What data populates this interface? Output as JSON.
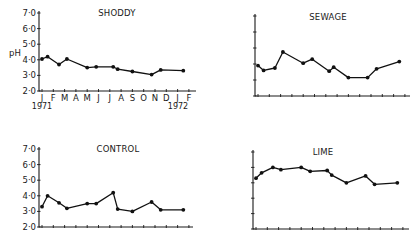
{
  "figure": {
    "ylabel": "pH",
    "years": {
      "start": "1971",
      "end": "1972"
    }
  },
  "chart_data": [
    {
      "type": "line",
      "title": "SHODDY",
      "xlabel": "Month (Jan 1971 – Feb 1972)",
      "ylabel": "pH",
      "categories": [
        "J",
        "F",
        "M",
        "A",
        "M",
        "J",
        "J",
        "A",
        "S",
        "O",
        "N",
        "D",
        "J",
        "F"
      ],
      "ylim": [
        2.0,
        7.0
      ],
      "yticks": [
        "2·0",
        "3·0",
        "4·0",
        "5·0",
        "6·0",
        "7·0"
      ],
      "show_tick_labels": true,
      "grid": false,
      "x": [
        0,
        0.5,
        1.5,
        2.2,
        4.0,
        4.8,
        6.3,
        6.7,
        8.0,
        9.7,
        10.5,
        12.5
      ],
      "values": [
        4.05,
        4.2,
        3.7,
        4.05,
        3.5,
        3.55,
        3.55,
        3.4,
        3.25,
        3.05,
        3.35,
        3.3
      ]
    },
    {
      "type": "line",
      "title": "SEWAGE",
      "xlabel": "Month (Jan 1971 – Feb 1972)",
      "ylabel": "pH",
      "categories": [
        "J",
        "F",
        "M",
        "A",
        "M",
        "J",
        "J",
        "A",
        "S",
        "O",
        "N",
        "D",
        "J",
        "F"
      ],
      "ylim": [
        2.0,
        7.0
      ],
      "show_tick_labels": false,
      "grid": false,
      "x": [
        0,
        0.5,
        1.5,
        2.2,
        4.0,
        4.8,
        6.3,
        6.7,
        8.0,
        9.7,
        10.5,
        12.5
      ],
      "values": [
        3.9,
        3.6,
        3.75,
        4.75,
        4.05,
        4.3,
        3.55,
        3.8,
        3.15,
        3.15,
        3.7,
        4.15
      ]
    },
    {
      "type": "line",
      "title": "CONTROL",
      "xlabel": "Month (Jan 1971 – Feb 1972)",
      "ylabel": "pH",
      "categories": [
        "J",
        "F",
        "M",
        "A",
        "M",
        "J",
        "J",
        "A",
        "S",
        "O",
        "N",
        "D",
        "J",
        "F"
      ],
      "ylim": [
        2.0,
        7.0
      ],
      "yticks": [
        "2·0",
        "3·0",
        "4·0",
        "5·0",
        "6·0",
        "7·0"
      ],
      "show_tick_labels": true,
      "grid": false,
      "x": [
        0,
        0.5,
        1.5,
        2.2,
        4.0,
        4.8,
        6.3,
        6.7,
        8.0,
        9.7,
        10.5,
        12.5
      ],
      "values": [
        3.3,
        4.0,
        3.55,
        3.2,
        3.5,
        3.5,
        4.2,
        3.15,
        3.0,
        3.6,
        3.1,
        3.1
      ]
    },
    {
      "type": "line",
      "title": "LIME",
      "xlabel": "Month (Jan 1971 – Feb 1972)",
      "ylabel": "pH",
      "categories": [
        "J",
        "F",
        "M",
        "A",
        "M",
        "J",
        "J",
        "A",
        "S",
        "O",
        "N",
        "D",
        "J",
        "F"
      ],
      "ylim": [
        2.0,
        7.0
      ],
      "show_tick_labels": false,
      "grid": false,
      "x": [
        0,
        0.5,
        1.5,
        2.2,
        4.0,
        4.8,
        6.3,
        6.7,
        8.0,
        9.7,
        10.5,
        12.5
      ],
      "values": [
        5.3,
        5.65,
        6.0,
        5.85,
        6.0,
        5.75,
        5.8,
        5.5,
        5.0,
        5.45,
        4.9,
        5.0
      ]
    }
  ]
}
